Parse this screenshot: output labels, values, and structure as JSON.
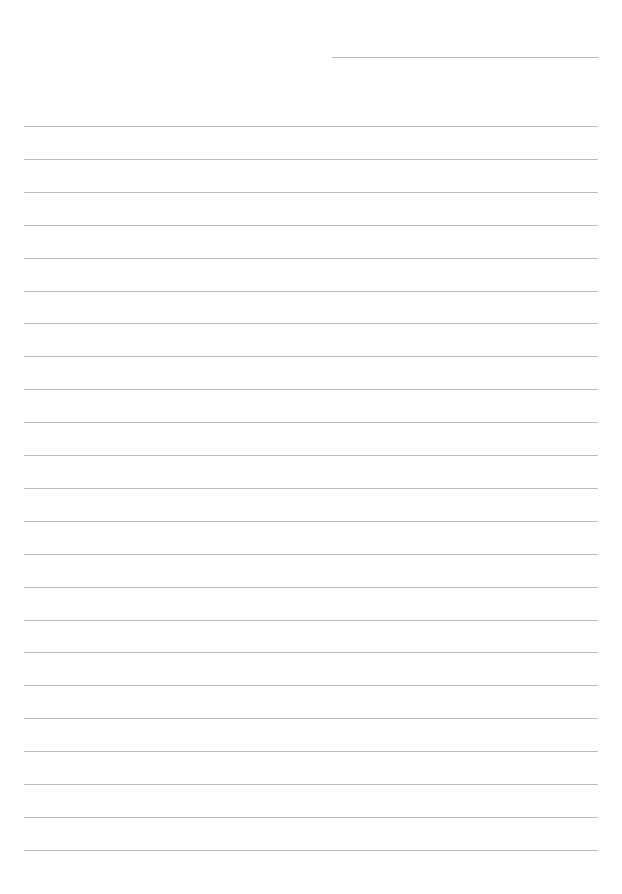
{
  "document": {
    "type": "lined-paper",
    "header_line": {
      "x": 332,
      "y": 57,
      "width": 266
    },
    "rules": {
      "count": 23,
      "first_y": 126,
      "spacing": 32.9,
      "x": 24,
      "width": 574,
      "color": "#bdbdbd"
    }
  }
}
